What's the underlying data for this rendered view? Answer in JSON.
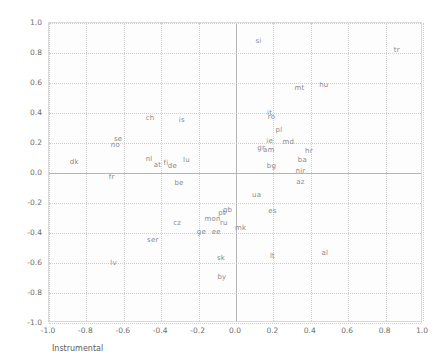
{
  "chart_data": {
    "type": "scatter",
    "title": "",
    "xlabel": "Instrumental",
    "ylabel": "Expressive",
    "xlim": [
      -1.0,
      1.0
    ],
    "ylim": [
      -1.0,
      1.0
    ],
    "grid": true,
    "legend": false,
    "marker_style": "text-label-only",
    "xticks": [
      "-1.0",
      "-0.8",
      "-0.6",
      "-0.4",
      "-0.2",
      "0.0",
      "0.2",
      "0.4",
      "0.6",
      "0.8",
      "1.0"
    ],
    "yticks": [
      "1.0",
      "0.8",
      "0.6",
      "0.4",
      "0.2",
      "0.0",
      "-0.2",
      "-0.4",
      "-0.6",
      "-0.8",
      "-1.0"
    ],
    "xtick_values": [
      -1.0,
      -0.8,
      -0.6,
      -0.4,
      -0.2,
      0.0,
      0.2,
      0.4,
      0.6,
      0.8,
      1.0
    ],
    "ytick_values": [
      1.0,
      0.8,
      0.6,
      0.4,
      0.2,
      0.0,
      -0.2,
      -0.4,
      -0.6,
      -0.8,
      -1.0
    ],
    "points": [
      {
        "label": "si",
        "x": 0.12,
        "y": 0.88
      },
      {
        "label": "tr",
        "x": 0.86,
        "y": 0.82
      },
      {
        "label": "hu",
        "x": 0.47,
        "y": 0.59
      },
      {
        "label": "mt",
        "x": 0.34,
        "y": 0.57
      },
      {
        "label": "it",
        "x": 0.18,
        "y": 0.4
      },
      {
        "label": "ro",
        "x": 0.19,
        "y": 0.375
      },
      {
        "label": "ch",
        "x": -0.46,
        "y": 0.365
      },
      {
        "label": "is",
        "x": -0.29,
        "y": 0.355
      },
      {
        "label": "pl",
        "x": 0.23,
        "y": 0.285
      },
      {
        "label": "se",
        "x": -0.63,
        "y": 0.225
      },
      {
        "label": "ie",
        "x": 0.18,
        "y": 0.215
      },
      {
        "label": "md",
        "x": 0.28,
        "y": 0.21
      },
      {
        "label": "no",
        "x": -0.645,
        "y": 0.185
      },
      {
        "label": "gr",
        "x": 0.135,
        "y": 0.165
      },
      {
        "label": "am",
        "x": 0.175,
        "y": 0.155
      },
      {
        "label": "hr",
        "x": 0.39,
        "y": 0.145
      },
      {
        "label": "nl",
        "x": -0.465,
        "y": 0.095
      },
      {
        "label": "lu",
        "x": -0.265,
        "y": 0.09
      },
      {
        "label": "ba",
        "x": 0.355,
        "y": 0.085
      },
      {
        "label": "dk",
        "x": -0.865,
        "y": 0.075
      },
      {
        "label": "fi",
        "x": -0.375,
        "y": 0.07
      },
      {
        "label": "at",
        "x": -0.42,
        "y": 0.055
      },
      {
        "label": "bg",
        "x": 0.19,
        "y": 0.05
      },
      {
        "label": "de",
        "x": -0.34,
        "y": 0.045
      },
      {
        "label": "nir",
        "x": 0.345,
        "y": 0.015
      },
      {
        "label": "fr",
        "x": -0.665,
        "y": -0.025
      },
      {
        "label": "az",
        "x": 0.345,
        "y": -0.06
      },
      {
        "label": "be",
        "x": -0.305,
        "y": -0.065
      },
      {
        "label": "ua",
        "x": 0.11,
        "y": -0.145
      },
      {
        "label": "gb",
        "x": -0.045,
        "y": -0.245
      },
      {
        "label": "es",
        "x": 0.195,
        "y": -0.25
      },
      {
        "label": "pt",
        "x": -0.075,
        "y": -0.265
      },
      {
        "label": "mon",
        "x": -0.125,
        "y": -0.305
      },
      {
        "label": "cz",
        "x": -0.315,
        "y": -0.33
      },
      {
        "label": "ru",
        "x": -0.065,
        "y": -0.335
      },
      {
        "label": "mk",
        "x": 0.025,
        "y": -0.365
      },
      {
        "label": "ge",
        "x": -0.185,
        "y": -0.39
      },
      {
        "label": "ee",
        "x": -0.105,
        "y": -0.395
      },
      {
        "label": "ser",
        "x": -0.445,
        "y": -0.445
      },
      {
        "label": "al",
        "x": 0.475,
        "y": -0.535
      },
      {
        "label": "lt",
        "x": 0.195,
        "y": -0.555
      },
      {
        "label": "sk",
        "x": -0.08,
        "y": -0.565
      },
      {
        "label": "lv",
        "x": -0.655,
        "y": -0.6
      },
      {
        "label": "by",
        "x": -0.075,
        "y": -0.695
      }
    ]
  },
  "colors": {
    "label_text": "#8a8a8a",
    "tick_text": "#6e6e6e",
    "axis_title": "#5c5c5c",
    "gridline": "#cfcfcf",
    "zero_line": "#b5b5b5",
    "frame": "#d9d9d9",
    "plot_background": "#fdfdfd",
    "page_background": "#ffffff"
  }
}
